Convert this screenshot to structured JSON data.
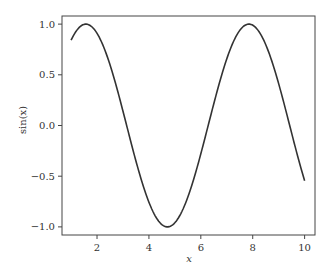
{
  "chart_data": {
    "type": "line",
    "title": "",
    "xlabel": "x",
    "ylabel": "sin(x)",
    "xlim": [
      0.65,
      10.4
    ],
    "ylim": [
      -1.08,
      1.08
    ],
    "xticks": [
      2,
      4,
      6,
      8,
      10
    ],
    "xtick_labels": [
      "2",
      "4",
      "6",
      "8",
      "10"
    ],
    "yticks": [
      1.0,
      0.5,
      0.0,
      -0.5,
      -1.0
    ],
    "ytick_labels": [
      "1.0",
      "0.5",
      "0.0",
      "-0.5",
      "-1.0"
    ],
    "grid": false,
    "legend": null,
    "series": [
      {
        "name": "sin(x)",
        "color": "#333333",
        "function": "sin(x)",
        "x_range": [
          1,
          10
        ],
        "x": [
          1,
          1.5708,
          2,
          3,
          3.1416,
          4,
          4.7124,
          5,
          6,
          6.2832,
          7,
          7.854,
          8,
          9,
          9.4248,
          10
        ],
        "y": [
          0.841,
          1.0,
          0.909,
          0.141,
          0.0,
          -0.757,
          -1.0,
          -0.959,
          -0.279,
          0.0,
          0.657,
          1.0,
          0.989,
          0.412,
          0.0,
          -0.544
        ]
      }
    ]
  }
}
